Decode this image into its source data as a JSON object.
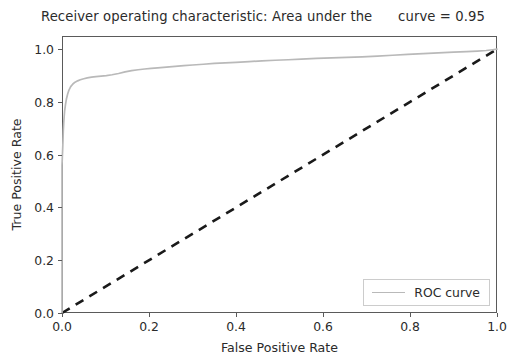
{
  "chart_data": {
    "type": "line",
    "title": "Receiver operating characteristic: Area under the      curve = 0.95",
    "xlabel": "False Positive Rate",
    "ylabel": "True Positive Rate",
    "xlim": [
      0.0,
      1.0
    ],
    "ylim": [
      0.0,
      1.05
    ],
    "grid": false,
    "legend_position": "lower right",
    "auc": 0.95,
    "xticks": [
      "0.0",
      "0.2",
      "0.4",
      "0.6",
      "0.8",
      "1.0"
    ],
    "xtick_values": [
      0.0,
      0.2,
      0.4,
      0.6,
      0.8,
      1.0
    ],
    "yticks": [
      "0.0",
      "0.2",
      "0.4",
      "0.6",
      "0.8",
      "1.0"
    ],
    "ytick_values": [
      0.0,
      0.2,
      0.4,
      0.6,
      0.8,
      1.0
    ],
    "series": [
      {
        "name": "ROC curve",
        "color": "#b9b9b9",
        "linestyle": "solid",
        "x": [
          0.0,
          0.0,
          0.002,
          0.003,
          0.004,
          0.005,
          0.006,
          0.008,
          0.01,
          0.013,
          0.016,
          0.02,
          0.025,
          0.03,
          0.036,
          0.042,
          0.05,
          0.058,
          0.068,
          0.078,
          0.09,
          0.102,
          0.115,
          0.13,
          0.145,
          0.16,
          0.175,
          0.19,
          0.205,
          0.22,
          0.24,
          0.26,
          0.28,
          0.3,
          0.325,
          0.35,
          0.375,
          0.4,
          0.43,
          0.46,
          0.49,
          0.52,
          0.55,
          0.585,
          0.62,
          0.655,
          0.69,
          0.725,
          0.76,
          0.795,
          0.83,
          0.865,
          0.9,
          0.93,
          0.955,
          0.975,
          0.99,
          1.0
        ],
        "y": [
          0.0,
          0.56,
          0.64,
          0.69,
          0.72,
          0.745,
          0.765,
          0.79,
          0.81,
          0.83,
          0.845,
          0.858,
          0.868,
          0.875,
          0.88,
          0.884,
          0.888,
          0.891,
          0.894,
          0.896,
          0.898,
          0.9,
          0.903,
          0.908,
          0.914,
          0.919,
          0.922,
          0.925,
          0.927,
          0.929,
          0.932,
          0.935,
          0.938,
          0.94,
          0.943,
          0.946,
          0.948,
          0.95,
          0.953,
          0.956,
          0.958,
          0.96,
          0.962,
          0.965,
          0.967,
          0.969,
          0.971,
          0.974,
          0.977,
          0.98,
          0.983,
          0.986,
          0.989,
          0.991,
          0.993,
          0.995,
          0.998,
          1.0
        ]
      },
      {
        "name": "chance-diagonal",
        "color": "#1a1a1a",
        "linestyle": "dashed",
        "x": [
          0.0,
          1.0
        ],
        "y": [
          0.0,
          1.0
        ]
      }
    ],
    "legend": [
      {
        "label": "ROC curve",
        "color": "#b9b9b9"
      }
    ]
  }
}
